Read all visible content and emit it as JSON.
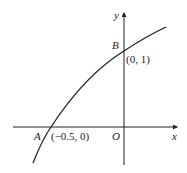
{
  "figure": {
    "axes": {
      "x_label": "x",
      "y_label": "y",
      "origin_label": "O"
    },
    "points": [
      {
        "name": "A",
        "coord_label": "(−0.5, 0)",
        "x": -0.5,
        "y": 0
      },
      {
        "name": "B",
        "coord_label": "(0, 1)",
        "x": 0,
        "y": 1
      }
    ],
    "curve": {
      "description": "increasing concave-down curve passing through A and B"
    },
    "colors": {
      "stroke": "#222222",
      "background": "#ffffff"
    }
  }
}
